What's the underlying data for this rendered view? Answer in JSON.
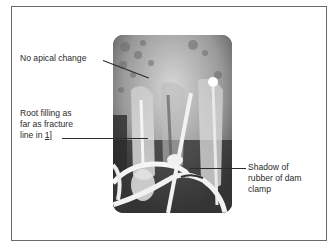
{
  "figure": {
    "top_cutoff_text": "(continued)",
    "annotations": [
      {
        "id": "apical",
        "text": "No apical change"
      },
      {
        "id": "root_filling",
        "lines": [
          "Root filling as",
          "far as fracture",
          "line in "
        ],
        "tooth_notation": "1]"
      },
      {
        "id": "shadow",
        "lines": [
          "Shadow of",
          "rubber of dam",
          "clamp"
        ]
      }
    ],
    "image": {
      "type": "dental radiograph",
      "subject": "upper incisors with root filling and rubber dam clamp"
    },
    "colors": {
      "border": "#6a6a6a",
      "text": "#2b2b2b",
      "background": "#ffffff"
    }
  }
}
